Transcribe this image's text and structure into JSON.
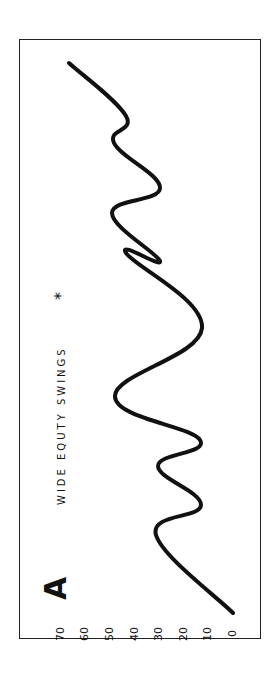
{
  "panel": {
    "letter": "A",
    "title": "WIDE EQUTY SWINGS",
    "marker": "*"
  },
  "chart_data": {
    "type": "line",
    "orientation": "rotated-90ccw (value axis horizontal, increasing leftward; time runs bottom to top)",
    "panel_label": "A",
    "xlabel": "",
    "ylabel": "",
    "yticks": [
      0,
      10,
      20,
      30,
      40,
      50,
      60,
      70
    ],
    "ylim": [
      0,
      70
    ],
    "grid": false,
    "legend": false,
    "x": [
      0,
      1,
      2,
      3,
      4,
      5,
      6,
      7,
      8,
      9,
      10,
      11,
      12,
      13
    ],
    "series": [
      {
        "name": "equity",
        "values": [
          0,
          31,
          13,
          30,
          13,
          48,
          12,
          43,
          29,
          49,
          29,
          48,
          43,
          66
        ]
      }
    ],
    "screen_points": [
      [
        233,
        613
      ],
      [
        156,
        535
      ],
      [
        201,
        505
      ],
      [
        158,
        466
      ],
      [
        200,
        440
      ],
      [
        115,
        396
      ],
      [
        202,
        328
      ],
      [
        126,
        253
      ],
      [
        160,
        261
      ],
      [
        112,
        213
      ],
      [
        160,
        188
      ],
      [
        114,
        143
      ],
      [
        126,
        116
      ],
      [
        69,
        63
      ]
    ]
  },
  "colors": {
    "line": "#111111",
    "frame": "#222222",
    "background": "#ffffff"
  }
}
